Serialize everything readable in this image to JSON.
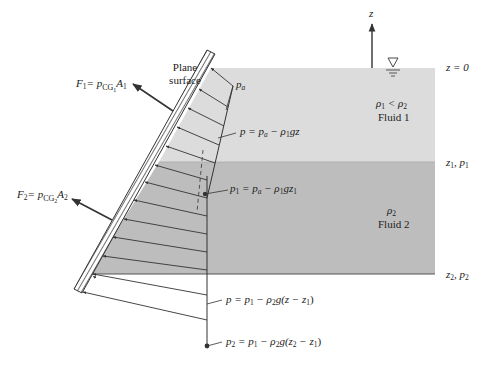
{
  "diagram": {
    "colors": {
      "fluid1": "#dcdcdc",
      "fluid2": "#bdbdbd",
      "lines": "#333333",
      "background": "#ffffff"
    },
    "labels": {
      "plane_surface_line1": "Plane",
      "plane_surface_line2": "surface",
      "z_axis": "z",
      "z0": "z = 0",
      "pa": "p",
      "pa_sub": "a",
      "eq_fluid1_p": "p = p",
      "eq_fluid1_sub_a": "a",
      "eq_fluid1_rest": " − ρ",
      "eq_fluid1_sub1": "1",
      "eq_fluid1_tail": "gz",
      "rho_compare": "ρ",
      "rho_compare_sub1": "1",
      "rho_compare_mid": " < ρ",
      "rho_compare_sub2": "2",
      "fluid1": "Fluid 1",
      "z1p1_z": "z",
      "z1p1_sub1": "1",
      "z1p1_mid": ", p",
      "z1p1_sub2": "1",
      "p1_eq_head": "p",
      "p1_eq_sub": "1",
      "p1_eq_mid": " = p",
      "p1_eq_sub_a": "a",
      "p1_eq_rest": " − ρ",
      "p1_eq_sub_1": "1",
      "p1_eq_gz": "gz",
      "p1_eq_sub_z1": "1",
      "rho2": "ρ",
      "rho2_sub": "2",
      "fluid2": "Fluid 2",
      "z2p2_z": "z",
      "z2p2_sub1": "2",
      "z2p2_mid": ", p",
      "z2p2_sub2": "2",
      "eq_fluid2": "p = p",
      "eq_fluid2_sub1": "1",
      "eq_fluid2_mid": " − ρ",
      "eq_fluid2_sub2": "2",
      "eq_fluid2_tail": "g(z − z",
      "eq_fluid2_sub3": "1",
      "eq_fluid2_close": ")",
      "p2_eq": "p",
      "p2_eq_sub": "2",
      "p2_eq_mid": " = p",
      "p2_eq_sub1": "1",
      "p2_eq_rest": " − ρ",
      "p2_eq_sub2": "2",
      "p2_eq_g": "g(z",
      "p2_eq_sub3": "2",
      "p2_eq_m": " − z",
      "p2_eq_sub4": "1",
      "p2_eq_close": ")",
      "F1": "F",
      "F1_sub": "1",
      "F1_eq": "= p",
      "F1_cg": "CG",
      "F1_cg_sub": "1",
      "F1_A": "A",
      "F1_A_sub": "1",
      "F2": "F",
      "F2_sub": "2",
      "F2_eq": "= p",
      "F2_cg": "CG",
      "F2_cg_sub": "2",
      "F2_A": "A",
      "F2_A_sub": "2"
    },
    "icons": {
      "free_surface": "inverted-triangle-water-level-icon"
    }
  }
}
